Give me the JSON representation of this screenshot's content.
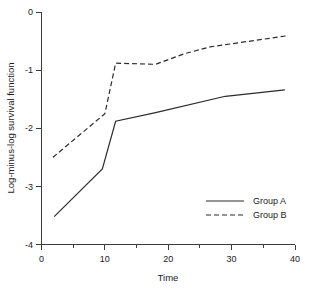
{
  "chart_data": {
    "type": "line",
    "title": "",
    "xlabel": "Time",
    "ylabel": "Log-minus-log survival function",
    "xlim": [
      0,
      40
    ],
    "ylim": [
      -4,
      0
    ],
    "xticks": [
      0,
      10,
      20,
      30,
      40
    ],
    "xtick_labels": [
      "0",
      "10",
      "20",
      "30",
      "40"
    ],
    "xminor_ticks": [
      5,
      15,
      25,
      35
    ],
    "yticks": [
      0,
      -1,
      -2,
      -3,
      -4
    ],
    "ytick_labels": [
      "0",
      "-1",
      "-2",
      "-3",
      "-4"
    ],
    "grid": false,
    "legend_position": "lower right",
    "series": [
      {
        "name": "Group A",
        "style": "solid",
        "color": "#2b2b2b",
        "x": [
          2.0,
          9.6,
          11.7,
          18.0,
          29.0,
          38.4
        ],
        "y": [
          -3.52,
          -2.7,
          -1.88,
          -1.73,
          -1.45,
          -1.34
        ]
      },
      {
        "name": "Group B",
        "style": "dashed",
        "color": "#2b2b2b",
        "x": [
          1.8,
          10.0,
          11.7,
          18.0,
          22.5,
          26.6,
          38.7
        ],
        "y": [
          -2.5,
          -1.75,
          -0.88,
          -0.9,
          -0.72,
          -0.6,
          -0.41
        ]
      }
    ],
    "legend": [
      {
        "label": "Group A",
        "style": "solid"
      },
      {
        "label": "Group B",
        "style": "dashed"
      }
    ]
  },
  "axes": {
    "x_title": "Time",
    "y_title": "Log-minus-log survival function"
  }
}
